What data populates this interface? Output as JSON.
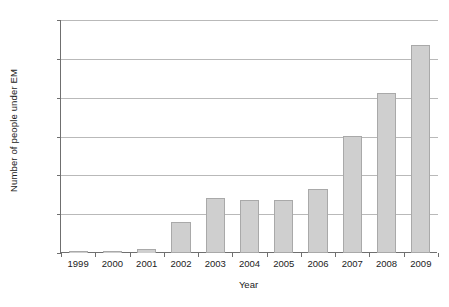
{
  "chart_data": {
    "type": "bar",
    "title": "",
    "xlabel": "Year",
    "ylabel": "Number of people under EM",
    "categories": [
      "1999",
      "2000",
      "2001",
      "2002",
      "2003",
      "2004",
      "2005",
      "2006",
      "2007",
      "2008",
      "2009"
    ],
    "values": [
      5,
      10,
      20,
      160,
      283,
      273,
      272,
      328,
      603,
      823,
      1071
    ],
    "ylim": [
      0,
      1200
    ],
    "ytick_values": [
      0,
      200,
      400,
      600,
      800,
      1000,
      1200
    ],
    "ytick_labels": [
      "0",
      "200",
      "400",
      "600",
      "800",
      "1,000",
      "1,200"
    ],
    "grid": true,
    "legend": "none",
    "bar_color": "#cfcfcf",
    "bar_border_color": "#a9a9a9",
    "gridline_color": "#b9b9b9",
    "axis_color": "#6f6f6f",
    "background_color": "#ffffff"
  }
}
